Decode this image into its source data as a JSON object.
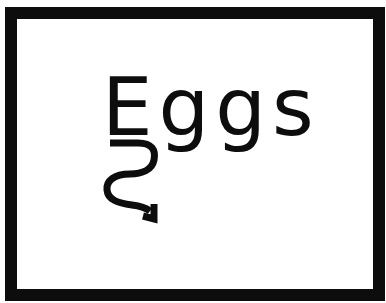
{
  "sign": {
    "word": "Eggs",
    "letters": [
      "E",
      "g",
      "g",
      "s"
    ],
    "border_color": "#0d0d0d",
    "text_color": "#0d0d0d",
    "background_color": "#ffffff",
    "decoration": "squiggly-arrow-from-E-pointing-down-right"
  }
}
